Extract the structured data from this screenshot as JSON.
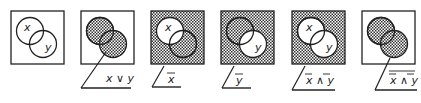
{
  "colors": {
    "stroke": "#222222",
    "shade_dark": "#333333",
    "shade_light": "#ffffff",
    "background": "#ffffff"
  },
  "panels": [
    {
      "id": "base",
      "caption": "",
      "caption_overline": "",
      "set_x_label": "x",
      "set_y_label": "y",
      "shaded": "none"
    },
    {
      "id": "or",
      "caption": "x ∨ y",
      "caption_overline": "",
      "set_x_label": "",
      "set_y_label": "",
      "shaded": "union"
    },
    {
      "id": "not-x",
      "caption": "x",
      "caption_overline": "x",
      "set_x_label": "x",
      "set_y_label": "",
      "shaded": "complement-x"
    },
    {
      "id": "not-y",
      "caption": "y",
      "caption_overline": "y",
      "set_x_label": "",
      "set_y_label": "y",
      "shaded": "complement-y"
    },
    {
      "id": "notx-and-noty",
      "caption": "x ∧ y",
      "caption_overline": "each",
      "set_x_label": "x",
      "set_y_label": "y",
      "shaded": "complement-union"
    },
    {
      "id": "not-notx-and-noty",
      "caption": "x ∧ y",
      "caption_overline": "whole",
      "set_x_label": "",
      "set_y_label": "",
      "shaded": "union"
    }
  ]
}
